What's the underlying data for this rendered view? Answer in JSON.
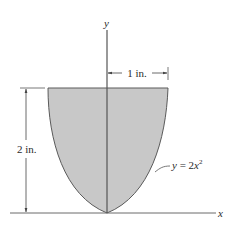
{
  "figure": {
    "axes": {
      "x_label": "x",
      "y_label": "y"
    },
    "dimensions": {
      "width_label": "1 in.",
      "height_label": "2 in."
    },
    "curve": {
      "equation_prefix": "y = 2",
      "equation_var": "x",
      "equation_exp": "2"
    },
    "colors": {
      "fill": "#c8c8c8",
      "stroke": "#555555",
      "axis": "#6a6a6a",
      "background": "#ffffff"
    }
  }
}
